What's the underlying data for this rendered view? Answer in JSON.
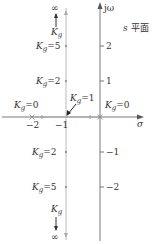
{
  "diagram": {
    "type": "root-locus",
    "plane_label": {
      "var": "s",
      "text": "平面"
    },
    "axes": {
      "real_axis_label": "σ",
      "imag_axis_label": "jω",
      "real_ticks": [
        "−2",
        "−1"
      ],
      "imag_ticks_pos": [
        "2",
        "1"
      ],
      "imag_ticks_neg": [
        "−1",
        "−2"
      ]
    },
    "gain_symbol": "K",
    "gain_subscript": "g",
    "annotations": {
      "kg0_left": "=0",
      "kg0_right": "=0",
      "kg1": "=1",
      "kg2_up": "=2",
      "kg5_up": "=5",
      "kg2_down": "=2",
      "kg5_down": "=5",
      "inf_top": "∞",
      "inf_bottom": "∞"
    },
    "poles": [
      0,
      -2
    ],
    "breakaway_point": -1,
    "colors": {
      "axis": "#555555",
      "locus": "#aaaaaa",
      "text": "#333333"
    }
  }
}
